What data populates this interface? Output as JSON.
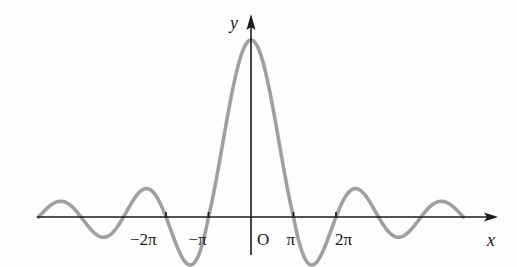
{
  "chart_data": {
    "type": "line",
    "title": "",
    "function_shape": "y = sin(x)/x (sinc-like damped oscillation)",
    "xlabel": "x",
    "ylabel": "y",
    "origin_label": "O",
    "x_ticks": [
      {
        "value": -6.2832,
        "label": "−2π"
      },
      {
        "value": -3.1416,
        "label": "−π"
      },
      {
        "value": 3.1416,
        "label": "π"
      },
      {
        "value": 6.2832,
        "label": "2π"
      }
    ],
    "xlim": [
      -5.0,
      5.8
    ],
    "xlim_units": "multiples of π",
    "ylim": [
      -0.25,
      1.2
    ],
    "grid": false,
    "legend": null,
    "series": [
      {
        "name": "curve",
        "color": "#a0a0a0",
        "x_pi": [
          -5,
          -4.5,
          -4,
          -3.5,
          -3,
          -2.5,
          -2,
          -1.5,
          -1,
          -0.5,
          0,
          0.5,
          1,
          1.5,
          2,
          2.5,
          3,
          3.5,
          4,
          4.5,
          5
        ],
        "y": [
          0,
          0.071,
          0,
          -0.091,
          0,
          0.127,
          0,
          -0.212,
          0,
          0.637,
          1,
          0.637,
          0,
          -0.212,
          0,
          0.127,
          0,
          -0.091,
          0,
          0.071,
          0
        ]
      }
    ]
  },
  "colors": {
    "axis": "#1a1a1a",
    "curve": "#a0a0a0",
    "background": "#fdfdfd"
  }
}
